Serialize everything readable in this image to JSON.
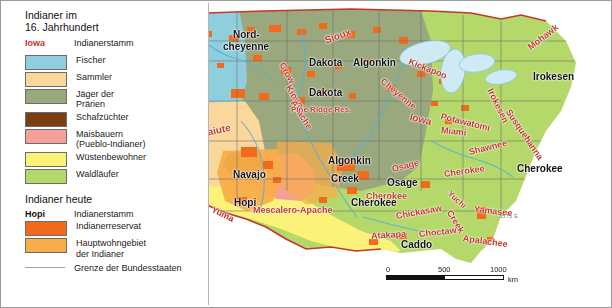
{
  "legend": {
    "title_line1": "Indianer im",
    "title_line2": "16. Jahrhundert",
    "sample_hist": "Iowa",
    "sample_hist_label": "Indianerstamm",
    "items": [
      {
        "label": "Fischer",
        "color": "#8fcfdd"
      },
      {
        "label": "Sammler",
        "color": "#fad79a"
      },
      {
        "label": "Jäger der\nPrärien",
        "color": "#9aa87e"
      },
      {
        "label": "Schafzüchter",
        "color": "#7b3f12"
      },
      {
        "label": "Maisbauern\n(Pueblo-Indianer)",
        "color": "#f4a098"
      },
      {
        "label": "Wüstenbewohner",
        "color": "#fbf27a"
      },
      {
        "label": "Waldläufer",
        "color": "#b4d96a"
      }
    ],
    "section_today": "Indianer heute",
    "sample_today": "Hopi",
    "sample_today_label": "Indianerstamm",
    "today_items": [
      {
        "label": "Indianerreservat",
        "color": "#f26a1b"
      },
      {
        "label": "Hauptwohngebiet\nder Indianer",
        "color": "#f9b councils"
      }
    ],
    "reservation_label": "Indianerreservat",
    "reservation_color": "#f26a1b",
    "mainarea_label": "Hauptwohngebiet\nder Indianer",
    "mainarea_color": "#f9ad4a",
    "border_label": "Grenze der Bundesstaaten"
  },
  "scale": {
    "t0": "0",
    "t500": "500",
    "t1000": "1000",
    "unit": "km"
  },
  "plate_code": "3575 E",
  "map_labels": {
    "historic": [
      {
        "text": "Chinook",
        "x": 148,
        "y": 70,
        "rot": -22,
        "size": 10
      },
      {
        "text": "Paiute",
        "x": 200,
        "y": 127,
        "rot": -12,
        "size": 10
      },
      {
        "text": "Crow",
        "x": 281,
        "y": 57,
        "rot": 62,
        "size": 9
      },
      {
        "text": "Kiowa-",
        "x": 287,
        "y": 80,
        "rot": 58,
        "size": 9
      },
      {
        "text": "Apache",
        "x": 292,
        "y": 95,
        "rot": 58,
        "size": 9
      },
      {
        "text": "Sioux",
        "x": 324,
        "y": 34,
        "rot": -20,
        "size": 10
      },
      {
        "text": "Pine Ridge Res.",
        "x": 290,
        "y": 104,
        "rot": 0,
        "size": 8
      },
      {
        "text": "Cheyenne",
        "x": 381,
        "y": 74,
        "rot": 40,
        "size": 9
      },
      {
        "text": "Kickapoo",
        "x": 408,
        "y": 55,
        "rot": 22,
        "size": 9
      },
      {
        "text": "Iowa",
        "x": 409,
        "y": 110,
        "rot": 14,
        "size": 10
      },
      {
        "text": "Potawatomi",
        "x": 440,
        "y": 110,
        "rot": 14,
        "size": 9
      },
      {
        "text": "Miami",
        "x": 440,
        "y": 124,
        "rot": 6,
        "size": 9
      },
      {
        "text": "Irokesen",
        "x": 489,
        "y": 83,
        "rot": 64,
        "size": 9
      },
      {
        "text": "Mohawk",
        "x": 528,
        "y": 42,
        "rot": -38,
        "size": 9
      },
      {
        "text": "Susquehanna",
        "x": 507,
        "y": 104,
        "rot": 56,
        "size": 9
      },
      {
        "text": "Shawnee",
        "x": 468,
        "y": 146,
        "rot": -14,
        "size": 9
      },
      {
        "text": "Osage",
        "x": 391,
        "y": 163,
        "rot": -14,
        "size": 9
      },
      {
        "text": "Cherokee",
        "x": 443,
        "y": 168,
        "rot": -8,
        "size": 9
      },
      {
        "text": "Cherokee",
        "x": 365,
        "y": 190,
        "rot": 0,
        "size": 9
      },
      {
        "text": "Yuchi",
        "x": 448,
        "y": 187,
        "rot": 42,
        "size": 8
      },
      {
        "text": "Creek",
        "x": 448,
        "y": 205,
        "rot": 58,
        "size": 9
      },
      {
        "text": "Yamasee",
        "x": 473,
        "y": 203,
        "rot": 6,
        "size": 9
      },
      {
        "text": "Chickasaw",
        "x": 395,
        "y": 210,
        "rot": -10,
        "size": 9
      },
      {
        "text": "Choctaw",
        "x": 418,
        "y": 228,
        "rot": -6,
        "size": 9
      },
      {
        "text": "Apalachee",
        "x": 462,
        "y": 232,
        "rot": 8,
        "size": 9
      },
      {
        "text": "Atakapa",
        "x": 370,
        "y": 230,
        "rot": -4,
        "size": 9
      },
      {
        "text": "Mescalero-Apache",
        "x": 252,
        "y": 204,
        "rot": 0,
        "size": 9
      },
      {
        "text": "Yuma",
        "x": 211,
        "y": 203,
        "rot": 26,
        "size": 9
      }
    ],
    "today": [
      {
        "text": "Athapasken",
        "x": 149,
        "y": 24,
        "rot": -16,
        "size": 10
      },
      {
        "text": "Nord-",
        "x": 232,
        "y": 28,
        "rot": 0,
        "size": 10
      },
      {
        "text": "cheyenne",
        "x": 222,
        "y": 40,
        "rot": 0,
        "size": 10
      },
      {
        "text": "Dakota",
        "x": 308,
        "y": 56,
        "rot": 0,
        "size": 10
      },
      {
        "text": "Dakota",
        "x": 308,
        "y": 86,
        "rot": 0,
        "size": 10
      },
      {
        "text": "Algonkin",
        "x": 352,
        "y": 56,
        "rot": 0,
        "size": 10
      },
      {
        "text": "Irokesen",
        "x": 532,
        "y": 70,
        "rot": 0,
        "size": 10
      },
      {
        "text": "Paiute",
        "x": 152,
        "y": 115,
        "rot": 0,
        "size": 10
      },
      {
        "text": "Navajo",
        "x": 232,
        "y": 168,
        "rot": 0,
        "size": 10
      },
      {
        "text": "Hopi",
        "x": 233,
        "y": 196,
        "rot": 0,
        "size": 10
      },
      {
        "text": "Algonkin",
        "x": 327,
        "y": 154,
        "rot": 0,
        "size": 10
      },
      {
        "text": "Creek",
        "x": 330,
        "y": 172,
        "rot": 0,
        "size": 10
      },
      {
        "text": "Osage",
        "x": 386,
        "y": 176,
        "rot": 0,
        "size": 10
      },
      {
        "text": "Cherokee",
        "x": 516,
        "y": 162,
        "rot": 0,
        "size": 10
      },
      {
        "text": "Cherokee",
        "x": 350,
        "y": 196,
        "rot": 0,
        "size": 10
      },
      {
        "text": "Caddo",
        "x": 400,
        "y": 238,
        "rot": 0,
        "size": 10
      }
    ]
  }
}
